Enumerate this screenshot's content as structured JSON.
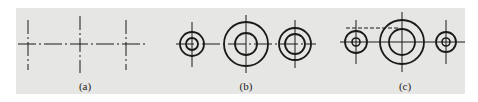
{
  "figure": {
    "background_color": "#e6e6e4",
    "line_color": "#1a1a1a",
    "panels": [
      {
        "id": "a",
        "label": "(a)",
        "label_x": 85,
        "description": "Three center-line crosses on a common horizontal axis"
      },
      {
        "id": "b",
        "label": "(b)",
        "label_x": 246,
        "description": "Three concentric circle pairs with center lines"
      },
      {
        "id": "c",
        "label": "(c)",
        "label_x": 405,
        "description": "Three concentric circle pairs with dashed hidden line"
      }
    ]
  }
}
